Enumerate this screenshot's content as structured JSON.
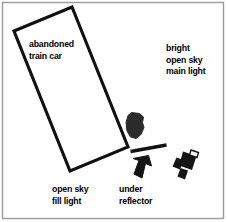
{
  "diagram": {
    "type": "lighting-setup-diagram",
    "width": 227,
    "height": 222,
    "background_color": "#ffffff",
    "ink_color": "#1a1a1a",
    "border_color": "#9a9a9a",
    "labels": {
      "subject": "abandoned\ntrain car",
      "main_light": "bright\nopen sky\nmain light",
      "fill_light": "open sky\nfill light",
      "reflector": "under\nreflector"
    },
    "elements": {
      "train_car": {
        "name": "abandoned train car",
        "shape": "tilted-rectangle",
        "corners": [
          [
            14,
            31
          ],
          [
            72,
            7
          ],
          [
            128,
            147
          ],
          [
            70,
            171
          ]
        ]
      },
      "figure": {
        "name": "subject figure",
        "shape": "blob",
        "center": [
          134,
          126
        ]
      },
      "reflector_bar": {
        "name": "under reflector",
        "shape": "thick-line",
        "from": [
          131,
          151
        ],
        "to": [
          166,
          145
        ]
      },
      "light_arrow": {
        "name": "fill light direction arrow",
        "shape": "arrow",
        "points_to": "up-left",
        "center": [
          144,
          168
        ]
      },
      "camera": {
        "name": "camera",
        "shape": "top-view-camera",
        "center": [
          186,
          163
        ]
      }
    }
  }
}
